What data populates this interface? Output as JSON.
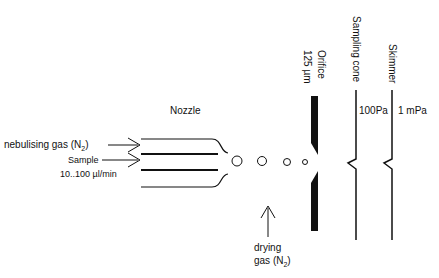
{
  "diagram": {
    "title_label": "Nozzle",
    "inputs": {
      "nebulising_gas": {
        "text": "nebulising gas (N",
        "sub": "2",
        "close": ")"
      },
      "sample": "Sample",
      "flow_rate": "10..100 µl/min"
    },
    "orifice": {
      "name": "Orifice",
      "size": "125 µm"
    },
    "sampling_cone": {
      "name": "Sampling cone",
      "pressure": "100Pa"
    },
    "skimmer": {
      "name": "Skimmer",
      "pressure": "1 mPa"
    },
    "drying_gas": {
      "line1": "drying",
      "line2": "gas (N",
      "sub": "2",
      "close": ")"
    },
    "droplets": [
      "large",
      "medium",
      "small",
      "smallest"
    ],
    "colors": {
      "stroke": "#111111",
      "background": "#ffffff"
    }
  }
}
